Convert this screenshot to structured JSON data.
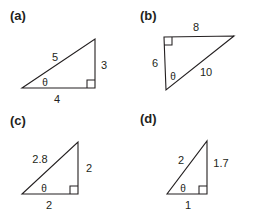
{
  "figure": {
    "kind": "right-triangle-diagram-set",
    "background_color": "#ffffff",
    "stroke_color": "#231f20",
    "panels": [
      {
        "id": "a",
        "label": "(a)",
        "label_pos": [
          10,
          15
        ],
        "vertices": {
          "angle_vertex": [
            22,
            88
          ],
          "right_angle_vertex": [
            95,
            88
          ],
          "apex": [
            95,
            39
          ]
        },
        "right_angle_marker": {
          "x": 95,
          "y": 88,
          "size": 8,
          "dir_x": -1,
          "dir_y": -1
        },
        "labels": [
          {
            "name": "hypotenuse-label",
            "text": "5",
            "pos": [
              55,
              57
            ]
          },
          {
            "name": "opposite-label",
            "text": "3",
            "pos": [
              104,
              65
            ]
          },
          {
            "name": "adjacent-label",
            "text": "4",
            "pos": [
              57,
              99
            ]
          },
          {
            "name": "angle-theta-label",
            "text": "θ",
            "pos": [
              45,
              82
            ]
          }
        ]
      },
      {
        "id": "b",
        "label": "(b)",
        "label_pos": [
          140,
          15
        ],
        "vertices": {
          "angle_vertex": [
            166,
            90
          ],
          "right_angle_vertex": [
            164,
            37
          ],
          "apex": [
            234,
            36
          ]
        },
        "right_angle_marker": {
          "x": 164,
          "y": 37,
          "size": 8,
          "dir_x": 1,
          "dir_y": 1
        },
        "labels": [
          {
            "name": "adjacent-label",
            "text": "6",
            "pos": [
              155,
              63
            ]
          },
          {
            "name": "opposite-label",
            "text": "8",
            "pos": [
              196,
              27
            ]
          },
          {
            "name": "hypotenuse-label",
            "text": "10",
            "pos": [
              206,
              72
            ]
          },
          {
            "name": "angle-theta-label",
            "text": "θ",
            "pos": [
              173,
              76
            ]
          }
        ]
      },
      {
        "id": "c",
        "label": "(c)",
        "label_pos": [
          10,
          120
        ],
        "vertices": {
          "angle_vertex": [
            22,
            194
          ],
          "right_angle_vertex": [
            78,
            194
          ],
          "apex": [
            78,
            142
          ]
        },
        "right_angle_marker": {
          "x": 78,
          "y": 194,
          "size": 8,
          "dir_x": -1,
          "dir_y": -1
        },
        "labels": [
          {
            "name": "hypotenuse-label",
            "text": "2.8",
            "pos": [
              40,
              159
            ]
          },
          {
            "name": "opposite-label",
            "text": "2",
            "pos": [
              89,
              168
            ]
          },
          {
            "name": "adjacent-label",
            "text": "2",
            "pos": [
              49,
              205
            ]
          },
          {
            "name": "angle-theta-label",
            "text": "θ",
            "pos": [
              44,
              188
            ]
          }
        ]
      },
      {
        "id": "d",
        "label": "(d)",
        "label_pos": [
          140,
          118
        ],
        "vertices": {
          "angle_vertex": [
            167,
            194
          ],
          "right_angle_vertex": [
            207,
            194
          ],
          "apex": [
            207,
            141
          ]
        },
        "right_angle_marker": {
          "x": 207,
          "y": 194,
          "size": 8,
          "dir_x": -1,
          "dir_y": -1
        },
        "labels": [
          {
            "name": "hypotenuse-label",
            "text": "2",
            "pos": [
              181,
              160
            ]
          },
          {
            "name": "opposite-label",
            "text": "1.7",
            "pos": [
              221,
              163
            ]
          },
          {
            "name": "adjacent-label",
            "text": "1",
            "pos": [
              188,
              205
            ]
          },
          {
            "name": "angle-theta-label",
            "text": "θ",
            "pos": [
              183,
              188
            ]
          }
        ]
      }
    ]
  }
}
